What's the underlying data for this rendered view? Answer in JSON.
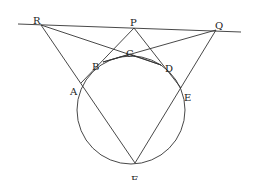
{
  "diagram": {
    "type": "geometry",
    "circle": {
      "cx": 131,
      "cy": 110,
      "r": 54
    },
    "points": {
      "R": {
        "x": 41,
        "y": 25,
        "label": "R",
        "lx": 33,
        "ly": 17
      },
      "P": {
        "x": 134,
        "y": 28,
        "label": "P",
        "lx": 130,
        "ly": 19
      },
      "Q": {
        "x": 216,
        "y": 30,
        "label": "Q",
        "lx": 215,
        "ly": 22
      },
      "C": {
        "x": 130,
        "y": 54,
        "label": "C",
        "lx": 126,
        "ly": 50
      },
      "B": {
        "x": 103,
        "y": 62,
        "label": "B",
        "lx": 92,
        "ly": 63
      },
      "D": {
        "x": 161,
        "y": 65,
        "label": "D",
        "lx": 165,
        "ly": 65
      },
      "A": {
        "x": 81,
        "y": 83,
        "label": "A",
        "lx": 70,
        "ly": 88
      },
      "E": {
        "x": 181,
        "y": 88,
        "label": "E",
        "lx": 184,
        "ly": 94
      },
      "F": {
        "x": 135,
        "y": 163,
        "label": "F",
        "lx": 131,
        "ly": 176
      }
    },
    "segments": [
      [
        "Rext",
        "Qext"
      ],
      [
        "R",
        "F"
      ],
      [
        "Q",
        "F"
      ],
      [
        "R",
        "D"
      ],
      [
        "Q",
        "B"
      ],
      [
        "P",
        "A"
      ],
      [
        "P",
        "E"
      ],
      [
        "B",
        "C"
      ],
      [
        "C",
        "D"
      ]
    ],
    "line_extent": {
      "x1": 18,
      "y1": 24,
      "x2": 241,
      "y2": 32
    }
  }
}
